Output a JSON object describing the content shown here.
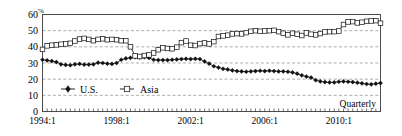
{
  "chart_data": {
    "type": "line",
    "title": "",
    "subtitle": "",
    "xlabel": "",
    "ylabel": "%",
    "unit_label": "%",
    "annotation": "Quarterly",
    "grid": true,
    "legend_position": "inside-bottom-left",
    "xlim": [
      "1994:1",
      "2012:2"
    ],
    "ylim": [
      0,
      60
    ],
    "yticks": [
      0,
      10,
      20,
      30,
      40,
      50,
      60
    ],
    "xtick_labels": [
      "1994:1",
      "1998:1",
      "2002:1",
      "2006:1",
      "2010:1"
    ],
    "xtick_values": [
      "1994:1",
      "1998:1",
      "2002:1",
      "2006:1",
      "2010:1"
    ],
    "x": [
      "1994:1",
      "1994:2",
      "1994:3",
      "1994:4",
      "1995:1",
      "1995:2",
      "1995:3",
      "1995:4",
      "1996:1",
      "1996:2",
      "1996:3",
      "1996:4",
      "1997:1",
      "1997:2",
      "1997:3",
      "1997:4",
      "1998:1",
      "1998:2",
      "1998:3",
      "1998:4",
      "1999:1",
      "1999:2",
      "1999:3",
      "1999:4",
      "2000:1",
      "2000:2",
      "2000:3",
      "2000:4",
      "2001:1",
      "2001:2",
      "2001:3",
      "2001:4",
      "2002:1",
      "2002:2",
      "2002:3",
      "2002:4",
      "2003:1",
      "2003:2",
      "2003:3",
      "2003:4",
      "2004:1",
      "2004:2",
      "2004:3",
      "2004:4",
      "2005:1",
      "2005:2",
      "2005:3",
      "2005:4",
      "2006:1",
      "2006:2",
      "2006:3",
      "2006:4",
      "2007:1",
      "2007:2",
      "2007:3",
      "2007:4",
      "2008:1",
      "2008:2",
      "2008:3",
      "2008:4",
      "2009:1",
      "2009:2",
      "2009:3",
      "2009:4",
      "2010:1",
      "2010:2",
      "2010:3",
      "2010:4",
      "2011:1",
      "2011:2",
      "2011:3",
      "2011:4",
      "2012:1",
      "2012:2"
    ],
    "series": [
      {
        "name": "U.S.",
        "marker": "filled-diamond",
        "color": "#111111",
        "values": [
          32.0,
          31.6,
          31.2,
          30.6,
          29.2,
          28.8,
          28.6,
          29.2,
          29.4,
          29.0,
          29.0,
          29.2,
          30.2,
          30.0,
          29.6,
          29.4,
          30.0,
          32.0,
          32.8,
          33.2,
          33.6,
          33.4,
          33.6,
          33.2,
          32.0,
          31.8,
          31.8,
          31.8,
          32.0,
          32.2,
          32.4,
          32.6,
          32.4,
          32.6,
          32.4,
          31.0,
          29.6,
          28.0,
          27.2,
          26.4,
          26.0,
          25.4,
          25.0,
          24.8,
          24.6,
          24.8,
          25.0,
          25.2,
          25.0,
          25.2,
          25.0,
          24.8,
          24.8,
          24.6,
          24.2,
          23.4,
          22.4,
          21.6,
          21.0,
          19.4,
          18.6,
          18.2,
          18.0,
          18.0,
          18.4,
          18.6,
          18.4,
          18.2,
          17.8,
          17.4,
          17.0,
          16.8,
          17.2,
          17.6
        ]
      },
      {
        "name": "Asia",
        "marker": "open-square",
        "color": "#111111",
        "values": [
          38.4,
          40.6,
          41.0,
          41.2,
          41.6,
          41.8,
          42.2,
          43.6,
          44.8,
          45.2,
          44.6,
          43.8,
          44.6,
          45.0,
          44.4,
          44.6,
          44.4,
          43.8,
          43.8,
          40.0,
          34.4,
          34.0,
          34.6,
          35.0,
          36.2,
          38.2,
          39.4,
          39.0,
          38.8,
          39.8,
          42.6,
          43.6,
          41.0,
          40.8,
          42.0,
          42.4,
          41.8,
          43.2,
          46.4,
          46.8,
          47.2,
          48.0,
          48.2,
          48.0,
          48.8,
          49.6,
          50.0,
          49.6,
          49.8,
          50.0,
          50.2,
          49.4,
          48.4,
          47.4,
          48.4,
          47.8,
          47.0,
          48.6,
          47.8,
          47.4,
          48.2,
          49.2,
          49.4,
          49.4,
          49.8,
          53.8,
          55.4,
          55.6,
          54.8,
          55.2,
          55.8,
          56.0,
          56.2,
          54.6
        ]
      }
    ]
  },
  "legend": {
    "items": [
      {
        "label": "U.S.",
        "marker": "filled-diamond"
      },
      {
        "label": "Asia",
        "marker": "open-square"
      }
    ]
  },
  "annotation": {
    "quarterly": "Quarterly"
  },
  "axes": {
    "y_unit": "%",
    "y_labels": [
      "60",
      "50",
      "40",
      "30",
      "20",
      "10",
      "0"
    ],
    "x_labels": [
      "1994:1",
      "1998:1",
      "2002:1",
      "2006:1",
      "2010:1"
    ]
  }
}
